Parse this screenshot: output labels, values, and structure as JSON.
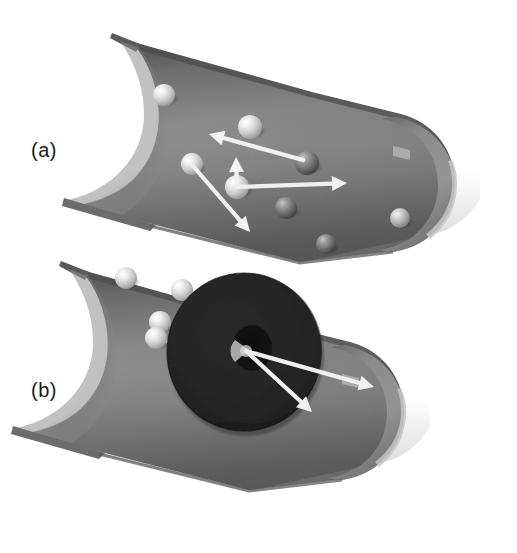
{
  "figure": {
    "background_color": "#ffffff",
    "width": 517,
    "height": 553
  },
  "labels": {
    "panel_a": "(a)",
    "panel_b": "(b)"
  },
  "palette": {
    "tube_body_light": "#9a9a9a",
    "tube_body_mid": "#7c7c7c",
    "tube_body_dark": "#5f5f5f",
    "tube_inner_shadow": "#5a5a5a",
    "tube_rim_highlight": "#c9c9c9",
    "tube_edge_dark": "#4a4a4a",
    "tube_cap_light": "#8d8d8d",
    "disk_dark": "#232323",
    "disk_hole": "#121212",
    "sphere_light": "#e8e8e8",
    "sphere_mid": "#b4b4b4",
    "sphere_dark": "#5a5a5a",
    "arrow_white": "#f2f2f2",
    "label_text": "#1b1b1b"
  },
  "panels": [
    {
      "id": "a",
      "label": "(a)",
      "description": "Upper cutaway tube containing free particles with scattered velocity arrows",
      "tube": {
        "opening": "concave-elliptical-cut-left",
        "cap": "rounded-right",
        "tilt_degrees": -18
      },
      "particles": [
        {
          "id": "a1",
          "cx": 164,
          "cy": 95,
          "r": 11,
          "shade": "light"
        },
        {
          "id": "a2",
          "cx": 250,
          "cy": 127,
          "r": 12,
          "shade": "light"
        },
        {
          "id": "a3",
          "cx": 307,
          "cy": 163,
          "r": 12,
          "shade": "dark"
        },
        {
          "id": "a4",
          "cx": 192,
          "cy": 164,
          "r": 11,
          "shade": "light"
        },
        {
          "id": "a5",
          "cx": 237,
          "cy": 187,
          "r": 12,
          "shade": "light"
        },
        {
          "id": "a6",
          "cx": 286,
          "cy": 208,
          "r": 11,
          "shade": "dark"
        },
        {
          "id": "a7",
          "cx": 326,
          "cy": 244,
          "r": 10,
          "shade": "dark"
        },
        {
          "id": "a8",
          "cx": 400,
          "cy": 218,
          "r": 10,
          "shade": "mid"
        }
      ],
      "arrows": [
        {
          "id": "a-arrow-1",
          "x1": 303,
          "y1": 160,
          "x2": 209,
          "y2": 134,
          "label": "scattered-velocity-up-left"
        },
        {
          "id": "a-arrow-2",
          "x1": 237,
          "y1": 187,
          "x2": 236,
          "y2": 157,
          "label": "scattered-velocity-up"
        },
        {
          "id": "a-arrow-3",
          "x1": 237,
          "y1": 187,
          "x2": 347,
          "y2": 183,
          "label": "scattered-velocity-right"
        },
        {
          "id": "a-arrow-4",
          "x1": 193,
          "y1": 166,
          "x2": 250,
          "y2": 232,
          "label": "scattered-velocity-down-right"
        }
      ]
    },
    {
      "id": "b",
      "label": "(b)",
      "description": "Lower cutaway tube with a large dark annular disk and collimated arrows from its central aperture",
      "tube": {
        "opening": "concave-elliptical-cut-left",
        "cap": "rounded-right",
        "tilt_degrees": -18
      },
      "disk": {
        "id": "dark-annular-disk",
        "cx": 244,
        "cy": 352,
        "outer_rx": 77,
        "outer_ry": 79,
        "hole_cx": 252,
        "hole_cy": 348,
        "hole_rx": 20,
        "hole_ry": 23
      },
      "particles": [
        {
          "id": "b1",
          "cx": 126,
          "cy": 278,
          "r": 11,
          "shade": "light"
        },
        {
          "id": "b2",
          "cx": 182,
          "cy": 290,
          "r": 11,
          "shade": "light"
        },
        {
          "id": "b3",
          "cx": 160,
          "cy": 322,
          "r": 11,
          "shade": "light"
        },
        {
          "id": "b4",
          "cx": 156,
          "cy": 338,
          "r": 11,
          "shade": "light"
        }
      ],
      "incoming_paths": [
        {
          "id": "b-path-1",
          "x1": 186,
          "y1": 295,
          "x2": 232,
          "y2": 332
        },
        {
          "id": "b-path-2",
          "x1": 162,
          "y1": 341,
          "x2": 238,
          "y2": 350
        }
      ],
      "arrows": [
        {
          "id": "b-arrow-1",
          "x1": 246,
          "y1": 351,
          "x2": 374,
          "y2": 387,
          "label": "collimated-beam-right"
        },
        {
          "id": "b-arrow-2",
          "x1": 246,
          "y1": 351,
          "x2": 312,
          "y2": 412,
          "label": "collimated-beam-down-right"
        }
      ]
    }
  ]
}
